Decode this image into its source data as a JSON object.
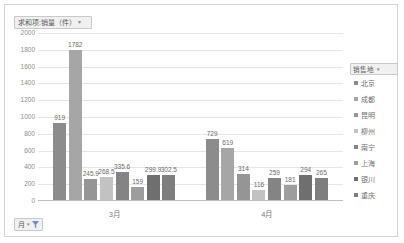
{
  "chart": {
    "value_field_label": "求和项:销量（件）",
    "value_field_caret": "▾",
    "month_filter_label": "月",
    "month_filter_caret": "▾",
    "legend_title": "销售地",
    "legend_caret": "▾"
  },
  "chart_data": {
    "type": "bar",
    "title": "求和项:销量（件）",
    "xlabel": "",
    "ylabel": "",
    "ylim": [
      0,
      2000
    ],
    "yticks": [
      2000,
      1800,
      1600,
      1400,
      1200,
      1000,
      800,
      600,
      400,
      200,
      0
    ],
    "ytick_labels": [
      "2000",
      "1800",
      "1600",
      "1400",
      "1200",
      "1000",
      "800",
      "600",
      "400",
      "200",
      "0"
    ],
    "grid": true,
    "legend_position": "right",
    "categories": [
      "3月",
      "4月"
    ],
    "series": [
      {
        "name": "北京",
        "color": "#8c8c8c",
        "values": [
          919,
          729
        ],
        "labels": [
          "919",
          "729"
        ]
      },
      {
        "name": "成都",
        "color": "#a6a6a6",
        "values": [
          1782,
          619
        ],
        "labels": [
          "1782",
          "619"
        ]
      },
      {
        "name": "昆明",
        "color": "#959595",
        "values": [
          245.9,
          314
        ],
        "labels": [
          "245.9",
          "314"
        ]
      },
      {
        "name": "柳州",
        "color": "#c2c2c2",
        "values": [
          268.5,
          116
        ],
        "labels": [
          "268.5",
          "116"
        ]
      },
      {
        "name": "南宁",
        "color": "#848484",
        "values": [
          335.6,
          259
        ],
        "labels": [
          "335.6",
          "259"
        ]
      },
      {
        "name": "上海",
        "color": "#9d9d9d",
        "values": [
          159,
          181
        ],
        "labels": [
          "159",
          "181"
        ]
      },
      {
        "name": "银川",
        "color": "#6f6f6f",
        "values": [
          299.9,
          294
        ],
        "labels": [
          "299.9",
          "294"
        ]
      },
      {
        "name": "重庆",
        "color": "#7e7e7e",
        "values": [
          302.5,
          265
        ],
        "labels": [
          "302.5",
          "265"
        ]
      }
    ]
  }
}
